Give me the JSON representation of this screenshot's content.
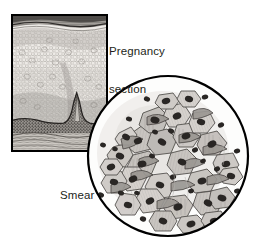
{
  "figure": {
    "background_color": "#ffffff",
    "ink_color": "#231f20",
    "labels": {
      "section_label_line1": "Pregnancy",
      "section_label_line2": "section",
      "smear_label": "Smear"
    },
    "section_inset": {
      "name": "pregnancy-section-inset",
      "border_color": "#000000",
      "border_width_px": 2.5,
      "x": 11,
      "y": 14,
      "width": 97,
      "height": 138,
      "description": "Histological section of stratified squamous epithelium in pregnancy",
      "layers": [
        {
          "name": "surface-keratin-band",
          "tone": "#4b4845"
        },
        {
          "name": "superficial-intermediate-cells",
          "tone": "#cfcbc6"
        },
        {
          "name": "vacuolated-glycogen-cells",
          "tone": "#e3e0db"
        },
        {
          "name": "basal-layer",
          "tone": "#55514d"
        },
        {
          "name": "stromal-papilla",
          "tone": "#3f3c39"
        },
        {
          "name": "connective-tissue-stroma",
          "tone": "#b9b4ae"
        }
      ]
    },
    "smear_circle": {
      "name": "smear-field-circle",
      "outline_color": "#000000",
      "outline_width_px": 2.2,
      "center_x": 168,
      "center_y": 156,
      "radius": 81,
      "description": "Cytology smear field showing clustered navicular cells with dark nuclei",
      "cell_fill_tone": "#bcb8b4",
      "nucleus_tone": "#2b2826",
      "cell_count": 56,
      "free_nucleus_count": 34
    }
  }
}
